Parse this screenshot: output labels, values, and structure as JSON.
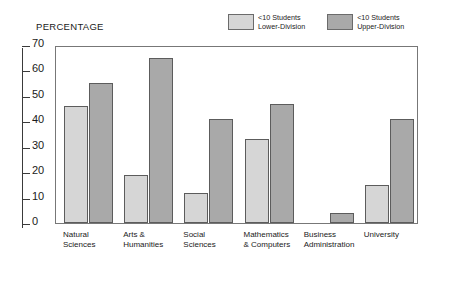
{
  "chart_data": {
    "type": "bar",
    "title": "",
    "ylabel": "PERCENTAGE",
    "xlabel": "",
    "ylim": [
      0,
      70
    ],
    "yticks": [
      0,
      10,
      20,
      30,
      40,
      50,
      60,
      70
    ],
    "grid": false,
    "legend_position": "top-right",
    "categories": [
      "Natural Sciences",
      "Arts & Humanities",
      "Social Sciences",
      "Mathematics & Computers",
      "Business Administration",
      "University"
    ],
    "category_lines": [
      {
        "line1": "Natural",
        "line2": "Sciences"
      },
      {
        "line1": "Arts &",
        "line2": "Humanities"
      },
      {
        "line1": "Social",
        "line2": "Sciences"
      },
      {
        "line1": "Mathematics",
        "line2": "& Computers"
      },
      {
        "line1": "Business",
        "line2": "Administration"
      },
      {
        "line1": "University",
        "line2": ""
      }
    ],
    "series": [
      {
        "name": "<10 Students Lower-Division",
        "color": "#d6d6d6",
        "values": [
          46,
          19,
          12,
          33,
          null,
          15
        ]
      },
      {
        "name": "<10 Students Upper-Division",
        "color": "#a9a9a9",
        "values": [
          55,
          65,
          41,
          47,
          4,
          41
        ]
      }
    ]
  },
  "legend": {
    "entries": [
      {
        "line1": "<10 Students",
        "line2": "Lower-Division",
        "swatch": "light"
      },
      {
        "line1": "<10 Students",
        "line2": "Upper-Division",
        "swatch": "dark"
      }
    ]
  },
  "colors": {
    "lower_division": "#d6d6d6",
    "upper_division": "#a9a9a9",
    "bar_border": "#5c5c5c",
    "frame": "#777777",
    "axis": "#3a3a3a",
    "text": "#1a1a1a",
    "background": "#ffffff"
  }
}
